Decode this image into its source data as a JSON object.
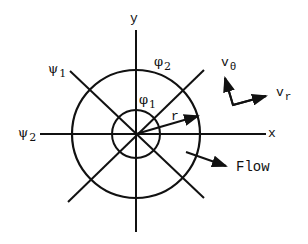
{
  "diagram": {
    "axes": {
      "x_label": "x",
      "y_label": "y"
    },
    "circles": [
      {
        "name": "phi_1",
        "label": "φ",
        "subscript": "1",
        "radius": 24
      },
      {
        "name": "phi_2",
        "label": "φ",
        "subscript": "2",
        "radius": 64
      }
    ],
    "radial_lines": [
      {
        "name": "psi_1",
        "label": "ψ",
        "subscript": "1",
        "direction": "diagonal"
      },
      {
        "name": "psi_2",
        "label": "ψ",
        "subscript": "2",
        "direction": "horizontal"
      }
    ],
    "radius_label": "r",
    "velocity_components": {
      "v_theta": {
        "label": "v",
        "subscript": "θ"
      },
      "v_r": {
        "label": "v",
        "subscript": "r"
      }
    },
    "flow_label": "Flow",
    "stroke_color": "#111111",
    "background": "#ffffff"
  }
}
